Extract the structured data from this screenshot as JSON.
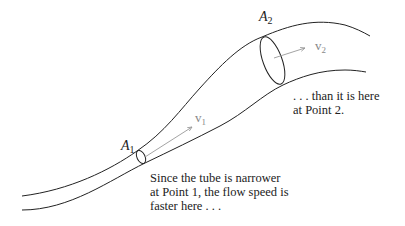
{
  "labels": {
    "area1": {
      "symbol": "A",
      "sub": "1"
    },
    "area2": {
      "symbol": "A",
      "sub": "2"
    },
    "velocity1": {
      "symbol": "v",
      "sub": "1"
    },
    "velocity2": {
      "symbol": "v",
      "sub": "2"
    }
  },
  "annotations": {
    "point1": [
      "Since the tube is narrower",
      "at Point 1, the flow speed is",
      "faster here . . ."
    ],
    "point2": [
      ". . . than it is here",
      "at Point 2."
    ]
  },
  "colors": {
    "tube_stroke": "#222222",
    "arrow_stroke": "#999999",
    "velocity_label": "#888888",
    "text": "#222222"
  }
}
